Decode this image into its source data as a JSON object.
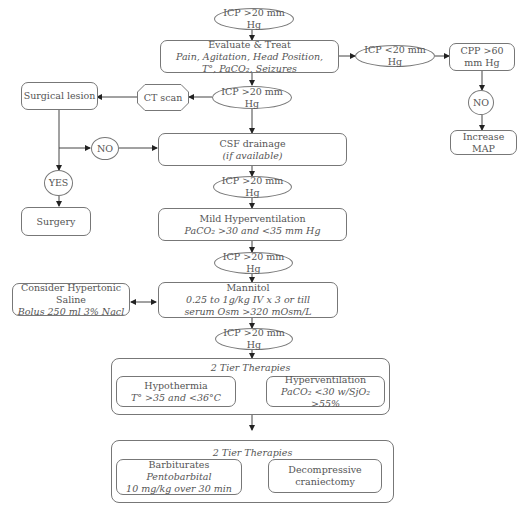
{
  "flowchart": {
    "start": {
      "label": "ICP >20 mm Hg"
    },
    "evaluate": {
      "title": "Evaluate & Treat",
      "line1": "Pain, Agitation, Head Position,",
      "line2": "T°, PaCO₂, Seizures"
    },
    "icp_low": {
      "label": "ICP <20 mm Hg"
    },
    "cpp": {
      "label": "CPP >60 mm Hg"
    },
    "cpp_no": {
      "label": "NO"
    },
    "increase_map": {
      "label": "Increase MAP"
    },
    "icp2": {
      "label": "ICP >20 mm Hg"
    },
    "ct_scan": {
      "label": "CT scan"
    },
    "surgical_lesion": {
      "label": "Surgical lesion"
    },
    "lesion_no": {
      "label": "NO"
    },
    "lesion_yes": {
      "label": "YES"
    },
    "surgery": {
      "label": "Surgery"
    },
    "csf": {
      "title": "CSF drainage",
      "subtitle": "(if available)"
    },
    "icp3": {
      "label": "ICP >20 mm Hg"
    },
    "mild_hv": {
      "title": "Mild Hyperventilation",
      "subtitle": "PaCO₂ >30 and <35 mm Hg"
    },
    "icp4": {
      "label": "ICP >20 mm Hg"
    },
    "mannitol": {
      "title": "Mannitol",
      "line1": "0.25 to 1g/kg IV x 3 or till",
      "line2": "serum Osm >320 mOsm/L"
    },
    "hypertonic": {
      "title": "Consider Hypertonic Saline",
      "subtitle": "Bolus 250 ml 3% Nacl"
    },
    "icp5": {
      "label": "ICP >20 mm Hg"
    },
    "tier1": {
      "title": "2 Tier Therapies",
      "left": {
        "title": "Hypothermia",
        "subtitle": "T° >35 and <36°C"
      },
      "right": {
        "title": "Hyperventilation",
        "subtitle": "PaCO₂ <30 w/SjO₂ >55%"
      }
    },
    "tier2": {
      "title": "2 Tier Therapies",
      "left": {
        "title": "Barbiturates",
        "line1": "Pentobarbital",
        "line2": "10 mg/kg over 30 min"
      },
      "right": {
        "line1": "Decompressive",
        "line2": "craniectomy"
      }
    }
  }
}
